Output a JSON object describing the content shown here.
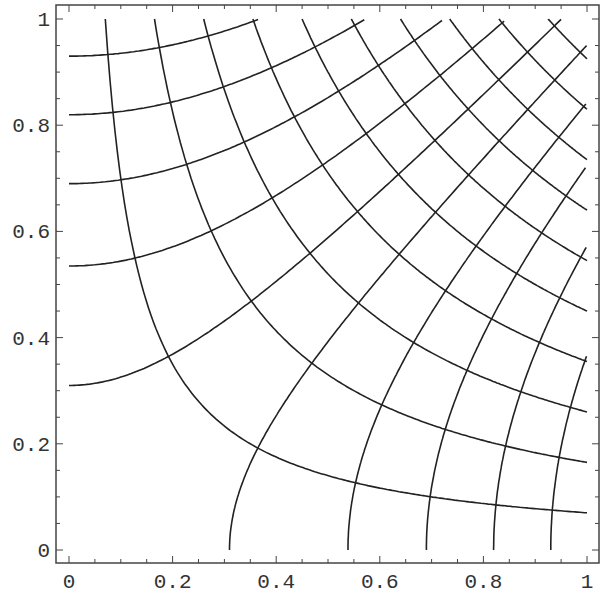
{
  "chart_data": {
    "type": "line",
    "title": "",
    "xlabel": "",
    "ylabel": "",
    "xlim": [
      0,
      1
    ],
    "ylim": [
      0,
      1
    ],
    "grid": false,
    "legend": null,
    "x_ticks": [
      "0",
      "0.2",
      "0.4",
      "0.6",
      "0.8",
      "1"
    ],
    "y_ticks": [
      "0",
      "0.2",
      "0.4",
      "0.6",
      "0.8",
      "1"
    ],
    "x_tick_values": [
      0,
      0.2,
      0.4,
      0.6,
      0.8,
      1
    ],
    "y_tick_values": [
      0,
      0.2,
      0.4,
      0.6,
      0.8,
      1
    ],
    "series": [
      {
        "name": "level curves x*y = c",
        "levels": [
          0.07,
          0.165,
          0.26,
          0.355,
          0.45,
          0.545,
          0.64,
          0.735,
          0.83,
          0.925
        ]
      },
      {
        "name": "level curves x^2 - y^2 = c",
        "levels": [
          -0.865,
          -0.672,
          -0.476,
          -0.286,
          -0.096,
          0.096,
          0.29,
          0.476,
          0.672,
          0.865
        ]
      }
    ]
  },
  "colors": {
    "curve": "#222222",
    "frame": "#444444",
    "text": "#333333",
    "background": "#ffffff"
  }
}
